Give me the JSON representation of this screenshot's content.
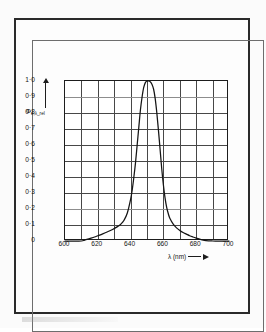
{
  "figure": {
    "y_axis_label_main": "Φ",
    "y_axis_label_sub": "e,λ_rel",
    "x_axis_label": "λ (nm)"
  },
  "conditions": {
    "current_symbol": "I",
    "current_sub": "F",
    "current_value": "= 20 mA",
    "temp_symbol": "t",
    "temp_sub": "U",
    "temp_value": "= 25 °C"
  },
  "chart_data": {
    "type": "line",
    "title": "",
    "xlabel": "λ (nm)",
    "ylabel": "Φe,λ_rel",
    "xlim": [
      600,
      700
    ],
    "ylim": [
      0,
      1.0
    ],
    "grid": true,
    "legend": null,
    "x_ticks": [
      600,
      620,
      640,
      660,
      680,
      700
    ],
    "x_tick_labels": [
      "600",
      "620",
      "640",
      "660",
      "680",
      "700"
    ],
    "x_minor_step": 10,
    "y_ticks": [
      0,
      0.1,
      0.2,
      0.3,
      0.4,
      0.5,
      0.6,
      0.7,
      0.8,
      0.9,
      1.0
    ],
    "y_tick_labels": [
      "0",
      "0·1",
      "0·2",
      "0·3",
      "0·4",
      "0·5",
      "0·6",
      "0·7",
      "0·8",
      "0·9",
      "1·0"
    ],
    "peak_wavelength_nm": 650,
    "peak_value": 1.0,
    "series": [
      {
        "name": "relative spectral radiant flux",
        "x": [
          600,
          605,
          610,
          612,
          615,
          618,
          620,
          623,
          626,
          629,
          632,
          634,
          636,
          638,
          640,
          641,
          642,
          643,
          644,
          645,
          646,
          647,
          648,
          649,
          650,
          651,
          652,
          653,
          654,
          655,
          656,
          657,
          658,
          659,
          660,
          661,
          662,
          663,
          664,
          666,
          668,
          670,
          672,
          674,
          676,
          678,
          680,
          683,
          686,
          690,
          695,
          700
        ],
        "y": [
          0.0,
          0.0,
          0.0,
          0.005,
          0.015,
          0.025,
          0.033,
          0.045,
          0.058,
          0.072,
          0.09,
          0.105,
          0.13,
          0.175,
          0.26,
          0.32,
          0.4,
          0.49,
          0.6,
          0.71,
          0.82,
          0.9,
          0.96,
          0.99,
          1.0,
          1.0,
          0.995,
          0.98,
          0.95,
          0.89,
          0.8,
          0.69,
          0.57,
          0.45,
          0.35,
          0.27,
          0.21,
          0.17,
          0.14,
          0.105,
          0.082,
          0.066,
          0.053,
          0.043,
          0.033,
          0.025,
          0.018,
          0.009,
          0.002,
          0.0,
          0.0,
          0.0
        ]
      }
    ],
    "annotations": [
      "I_F = 20 mA",
      "t_U = 25 °C"
    ]
  }
}
